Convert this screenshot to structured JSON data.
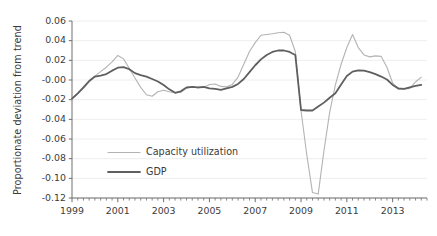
{
  "chart_data": {
    "type": "line",
    "title": "",
    "subtitle": "",
    "xlabel": "",
    "ylabel": "Proportionate deviation from trend",
    "xlim": [
      1999.0,
      2014.5
    ],
    "ylim": [
      -0.12,
      0.06
    ],
    "grid": "horizontal",
    "legend_position": "inside lower-left",
    "y_ticks": [
      0.06,
      0.04,
      0.02,
      -0.0,
      -0.02,
      -0.04,
      -0.06,
      -0.08,
      -0.1,
      -0.12
    ],
    "y_tick_labels": [
      "0.06",
      "0.04",
      "0.02",
      "-0.00",
      "-0.02",
      "-0.04",
      "-0.06",
      "-0.08",
      "-0.10",
      "-0.12"
    ],
    "x_ticks": [
      1999,
      2001,
      2003,
      2005,
      2007,
      2009,
      2011,
      2013
    ],
    "x_tick_labels": [
      "1999",
      "2001",
      "2003",
      "2005",
      "2007",
      "2009",
      "2011",
      "2013"
    ],
    "x_minor_tick_step": 0.25,
    "x": [
      1999.0,
      1999.25,
      1999.5,
      1999.75,
      2000.0,
      2000.25,
      2000.5,
      2000.75,
      2001.0,
      2001.25,
      2001.5,
      2001.75,
      2002.0,
      2002.25,
      2002.5,
      2002.75,
      2003.0,
      2003.25,
      2003.5,
      2003.75,
      2004.0,
      2004.25,
      2004.5,
      2004.75,
      2005.0,
      2005.25,
      2005.5,
      2005.75,
      2006.0,
      2006.25,
      2006.5,
      2006.75,
      2007.0,
      2007.25,
      2007.5,
      2007.75,
      2008.0,
      2008.25,
      2008.5,
      2008.75,
      2009.0,
      2009.25,
      2009.5,
      2009.75,
      2010.0,
      2010.25,
      2010.5,
      2010.75,
      2011.0,
      2011.25,
      2011.5,
      2011.75,
      2012.0,
      2012.25,
      2012.5,
      2012.75,
      2013.0,
      2013.25,
      2013.5,
      2013.75,
      2014.0,
      2014.25
    ],
    "series": [
      {
        "name": "Capacity utilization",
        "color": "#b3b3b3",
        "linewidth": 1.1,
        "values": [
          -0.0195,
          -0.014,
          -0.0085,
          -0.002,
          0.004,
          0.0085,
          0.013,
          0.0185,
          0.025,
          0.0215,
          0.012,
          0.002,
          -0.0075,
          -0.015,
          -0.0165,
          -0.012,
          -0.0105,
          -0.012,
          -0.013,
          -0.0125,
          -0.0085,
          -0.007,
          -0.008,
          -0.0075,
          -0.0045,
          -0.004,
          -0.0065,
          -0.007,
          -0.0045,
          0.003,
          0.016,
          0.029,
          0.038,
          0.0455,
          0.0462,
          0.047,
          0.048,
          0.0485,
          0.0455,
          0.029,
          -0.031,
          -0.076,
          -0.1145,
          -0.116,
          -0.072,
          -0.033,
          -0.005,
          0.016,
          0.033,
          0.0462,
          0.033,
          0.0255,
          0.0235,
          0.0245,
          0.024,
          0.013,
          -0.003,
          -0.0095,
          -0.009,
          -0.0085,
          -0.002,
          0.003
        ]
      },
      {
        "name": "GDP",
        "color": "#5f5f5f",
        "linewidth": 1.8,
        "values": [
          -0.019,
          -0.0135,
          -0.0075,
          -0.001,
          0.0035,
          0.0045,
          0.006,
          0.0095,
          0.0125,
          0.013,
          0.011,
          0.007,
          0.005,
          0.0035,
          0.001,
          -0.0015,
          -0.005,
          -0.0095,
          -0.013,
          -0.0115,
          -0.0075,
          -0.007,
          -0.0075,
          -0.007,
          -0.0085,
          -0.009,
          -0.01,
          -0.0085,
          -0.007,
          -0.004,
          0.001,
          0.008,
          0.015,
          0.021,
          0.0255,
          0.0285,
          0.03,
          0.03,
          0.0285,
          0.0255,
          -0.0305,
          -0.031,
          -0.031,
          -0.027,
          -0.023,
          -0.018,
          -0.0135,
          -0.0045,
          0.004,
          0.0085,
          0.0098,
          0.0095,
          0.008,
          0.006,
          0.0035,
          0.0005,
          -0.005,
          -0.0085,
          -0.009,
          -0.0075,
          -0.006,
          -0.005
        ]
      }
    ]
  },
  "legend": {
    "items": [
      {
        "label": "Capacity utilization"
      },
      {
        "label": "GDP"
      }
    ]
  },
  "axes": {
    "y_title": "Proportionate deviation from trend"
  }
}
